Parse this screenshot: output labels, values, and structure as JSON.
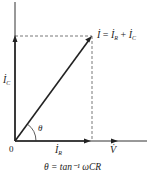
{
  "diagram": {
    "labels": {
      "i_total": "İ = İR + İC",
      "i_total_lhs": "İ",
      "eq": "=",
      "i_r_term": "İ",
      "i_r_sub": "R",
      "plus": "+",
      "i_c_term": "İ",
      "i_c_sub": "C",
      "i_c": "İ",
      "i_c_sub_axis": "C",
      "i_r": "İ",
      "i_r_sub_axis": "R",
      "v": "V̇",
      "origin": "0",
      "theta": "θ",
      "formula": "θ = tan⁻¹ ωCR"
    },
    "colors": {
      "line": "#222222",
      "dashed": "#555555",
      "background": "#ffffff"
    }
  }
}
